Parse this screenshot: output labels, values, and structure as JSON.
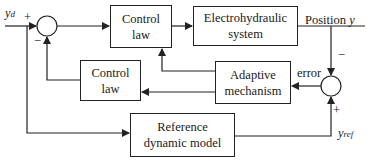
{
  "diagram": {
    "type": "block-diagram",
    "blocks": {
      "control_law_main": "Control\nlaw",
      "plant": "Electrohydraulic\nsystem",
      "control_law_feedback": "Control\nlaw",
      "adaptive_mechanism": "Adaptive\nmechanism",
      "reference_model": "Reference\ndynamic model"
    },
    "signals": {
      "input": "y",
      "input_sub": "d",
      "output": "Position ",
      "output_var": "y",
      "error": "error",
      "reference": "y",
      "reference_sub": "ref"
    },
    "signs": {
      "sum1_plus": "+",
      "sum1_minus": "−",
      "sum2_minus": "−",
      "sum2_plus": "+"
    },
    "colors": {
      "line": "#222222",
      "background": "#ffffff"
    }
  }
}
